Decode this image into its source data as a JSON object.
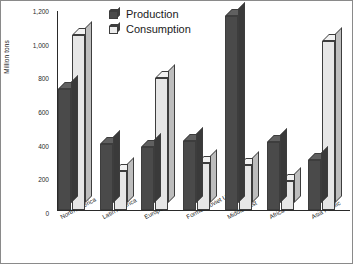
{
  "chart_data": {
    "type": "bar",
    "title": "",
    "xlabel": "",
    "ylabel": "Million tons",
    "ylim": [
      0,
      1200
    ],
    "yticks": [
      0,
      200,
      400,
      600,
      800,
      1000,
      1200
    ],
    "ytick_labels": [
      "0",
      "200",
      "400",
      "600",
      "800",
      "1,000",
      "1,200"
    ],
    "grid": false,
    "legend_position": "top-center",
    "style": "3d-grouped-bars",
    "categories": [
      "North America",
      "Latin America",
      "Europe",
      "Former Soviet Union",
      "Middle East",
      "Africa",
      "Asia Pacific"
    ],
    "series": [
      {
        "name": "Production",
        "color": "#4a4a4a",
        "values": [
          720,
          395,
          375,
          410,
          1160,
          405,
          300
        ]
      },
      {
        "name": "Consumption",
        "color": "#e6e6e6",
        "values": [
          1045,
          235,
          790,
          280,
          270,
          175,
          1010
        ]
      }
    ]
  }
}
